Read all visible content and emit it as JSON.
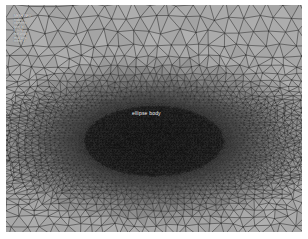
{
  "figure": {
    "kind": "finite-element-mesh",
    "background_color": "#a9a9a9",
    "line_color": "#3a3a3a",
    "page_color": "#ffffff",
    "frame": {
      "x": 6,
      "y": 5,
      "width": 296,
      "height": 227
    }
  },
  "overlay_stats": {
    "lines": [
      "MESH INFO",
      "nodes",
      "elements",
      "type: tri",
      "quality",
      "min angle",
      "max area",
      "refine: 3"
    ]
  },
  "body_label": {
    "text": "ellipse body"
  },
  "chart_data": {
    "type": "scatter",
    "xlabel": "",
    "ylabel": "",
    "xlim": [
      0,
      296
    ],
    "ylim": [
      0,
      227
    ],
    "grid": false,
    "legend_position": "none",
    "mesh": {
      "background_triangle_size": 15,
      "jitter": 0.42,
      "line_width": 0.55,
      "seed": 20250117,
      "refinement": {
        "center_x": 0.5,
        "center_y": 0.6,
        "ellipse_rx": 0.235,
        "ellipse_ry": 0.155,
        "core_scale": 0.18,
        "falloff": 2.1
      },
      "wake": {
        "half_height": 0.022,
        "left_extent": 0.28,
        "right_extent": 0.3,
        "darkness": 0.55
      },
      "shading": {
        "core_fill": "#1c1c1c",
        "mid_fill": "#6d6d6d",
        "outer_fill": "#a9a9a9"
      }
    }
  }
}
